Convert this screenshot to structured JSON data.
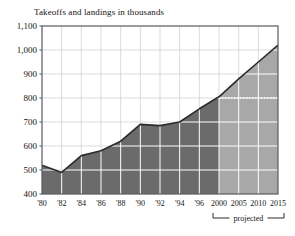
{
  "chart_data": {
    "type": "area",
    "title": "Takeoffs and landings in thousands",
    "xlabel": "",
    "ylabel": "",
    "ylim": [
      400,
      1100
    ],
    "ytick_labels": [
      "1,100",
      "1,000",
      "900",
      "800",
      "700",
      "600",
      "500",
      "400"
    ],
    "ytick_values": [
      1100,
      1000,
      900,
      800,
      700,
      600,
      500,
      400
    ],
    "xtick_labels": [
      "'80",
      "'82",
      "'84",
      "'86",
      "'88",
      "'90",
      "'92",
      "'94",
      "'96",
      "2000",
      "2005",
      "2010",
      "2015"
    ],
    "xtick_values": [
      1980,
      1982,
      1984,
      1986,
      1988,
      1990,
      1992,
      1994,
      1996,
      2000,
      2005,
      2010,
      2015
    ],
    "x": [
      1980,
      1982,
      1984,
      1986,
      1988,
      1990,
      1992,
      1994,
      1996,
      2000,
      2005,
      2010,
      2015
    ],
    "values": [
      520,
      490,
      560,
      580,
      620,
      690,
      685,
      700,
      755,
      805,
      880,
      950,
      1020
    ],
    "grid": true,
    "legend_position": "none",
    "projection_start": 2000,
    "projection_label": "projected",
    "reference_line": {
      "value": 800,
      "from": 2000,
      "to": 2015,
      "style": "dotted",
      "color": "#ffffff"
    },
    "series": [
      {
        "name": "Takeoffs and landings",
        "values": [
          520,
          490,
          560,
          580,
          620,
          690,
          685,
          700,
          755,
          805,
          880,
          950,
          1020
        ]
      }
    ],
    "colors": {
      "actual_fill": "#6b6b6b",
      "projected_fill": "#a8a8a8",
      "line": "#2b2b2b",
      "grid": "#ffffff",
      "axis": "#5a5a5a",
      "text": "#141414",
      "background": "#ffffff"
    }
  }
}
